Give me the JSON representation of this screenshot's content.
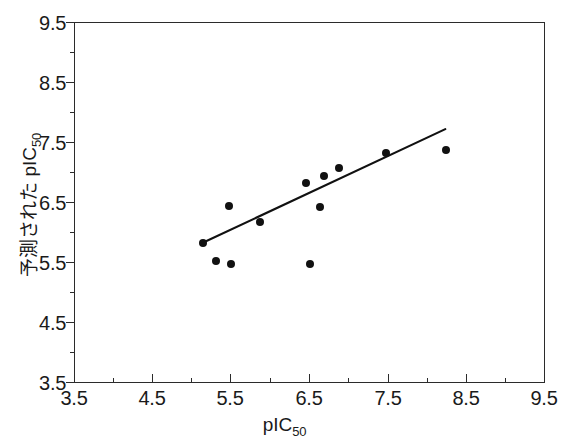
{
  "chart_data": {
    "type": "scatter",
    "title": "",
    "xlabel": "pIC50",
    "ylabel": "予測された pIC50",
    "xlabel_base": "pIC",
    "xlabel_sub": "50",
    "ylabel_base": "予測された pIC",
    "ylabel_sub": "50",
    "xlim": [
      3.5,
      9.5
    ],
    "ylim": [
      3.5,
      9.5
    ],
    "grid": false,
    "legend": null,
    "xticks": [
      3.5,
      4.5,
      5.5,
      6.5,
      7.5,
      8.5,
      9.5
    ],
    "yticks": [
      3.5,
      4.5,
      5.5,
      6.5,
      7.5,
      8.5,
      9.5
    ],
    "xtick_labels": [
      "3.5",
      "4.5",
      "5.5",
      "6.5",
      "7.5",
      "8.5",
      "9.5"
    ],
    "ytick_labels": [
      "3.5",
      "4.5",
      "5.5",
      "6.5",
      "7.5",
      "8.5",
      "9.5"
    ],
    "xminor_ticks": [
      4.0,
      5.0,
      6.0,
      7.0,
      8.0,
      9.0
    ],
    "yminor_ticks": [
      4.0,
      5.0,
      6.0,
      7.0,
      8.0,
      9.0
    ],
    "marker": "filled-circle",
    "marker_color": "#111111",
    "points": [
      {
        "x": 5.14,
        "y": 5.83
      },
      {
        "x": 5.31,
        "y": 5.53
      },
      {
        "x": 5.5,
        "y": 5.47
      },
      {
        "x": 5.47,
        "y": 6.45
      },
      {
        "x": 5.87,
        "y": 6.17
      },
      {
        "x": 6.46,
        "y": 6.82
      },
      {
        "x": 6.5,
        "y": 5.47
      },
      {
        "x": 6.64,
        "y": 6.42
      },
      {
        "x": 6.69,
        "y": 6.94
      },
      {
        "x": 6.87,
        "y": 7.08
      },
      {
        "x": 7.48,
        "y": 7.33
      },
      {
        "x": 8.24,
        "y": 7.38
      }
    ],
    "trendline": {
      "type": "linear-fit",
      "color": "#111111",
      "x_start": 5.14,
      "y_start": 5.83,
      "x_end": 8.23,
      "y_end": 7.72
    }
  }
}
